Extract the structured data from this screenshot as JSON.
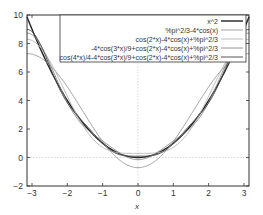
{
  "chart_data": {
    "type": "line",
    "title": "",
    "xlabel": "x",
    "ylabel": "",
    "xlim": [
      -3.14159,
      3.14159
    ],
    "ylim": [
      -2,
      10
    ],
    "xticks": [
      -3,
      -2,
      -1,
      0,
      1,
      2,
      3
    ],
    "yticks": [
      -2,
      0,
      2,
      4,
      6,
      8,
      10
    ],
    "grid": false,
    "zero_axes": true,
    "legend_position": "top-right",
    "series": [
      {
        "name": "x^2",
        "expr": "x*x",
        "color": "#222222",
        "width": 1.4
      },
      {
        "name": "%pi^2/3-4*cos(x)",
        "expr": "PI*PI/3-4*Math.cos(x)",
        "color": "#9a9a9a",
        "width": 0.9
      },
      {
        "name": "cos(2*x)-4*cos(x)+%pi^2/3",
        "expr": "Math.cos(2*x)-4*Math.cos(x)+PI*PI/3",
        "color": "#b4b4b4",
        "width": 0.9
      },
      {
        "name": "-4*cos(3*x)/9+cos(2*x)-4*cos(x)+%pi^2/3",
        "expr": "-4*Math.cos(3*x)/9+Math.cos(2*x)-4*Math.cos(x)+PI*PI/3",
        "color": "#8a8a8a",
        "width": 0.9
      },
      {
        "name": "cos(4*x)/4-4*cos(3*x)/9+cos(2*x)-4*cos(x)+%pi^2/3",
        "expr": "Math.cos(4*x)/4-4*Math.cos(3*x)/9+Math.cos(2*x)-4*Math.cos(x)+PI*PI/3",
        "color": "#555555",
        "width": 1.0
      }
    ]
  },
  "axes": {
    "x_label": "x",
    "x_tick_labels": [
      "-3",
      "-2",
      "-1",
      "0",
      "1",
      "2",
      "3"
    ],
    "y_tick_labels": [
      "-2",
      "0",
      "2",
      "4",
      "6",
      "8",
      "10"
    ]
  },
  "legend": {
    "items": [
      "x^2",
      "%pi^2/3-4*cos(x)",
      "cos(2*x)-4*cos(x)+%pi^2/3",
      "-4*cos(3*x)/9+cos(2*x)-4*cos(x)+%pi^2/3",
      "cos(4*x)/4-4*cos(3*x)/9+cos(2*x)-4*cos(x)+%pi^2/3"
    ]
  }
}
